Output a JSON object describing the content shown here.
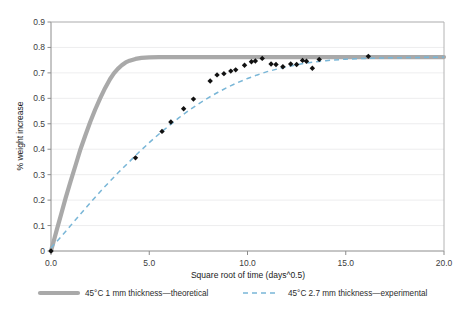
{
  "chart_data": {
    "type": "line",
    "title": "",
    "xlabel": "Square root of time (days^0.5)",
    "ylabel": "% weight increase",
    "xlim": [
      0.0,
      20.0
    ],
    "ylim": [
      0.0,
      0.9
    ],
    "xticks": [
      "0.0",
      "5.0",
      "10.0",
      "15.0",
      "20.0"
    ],
    "xtick_values": [
      0.0,
      5.0,
      10.0,
      15.0,
      20.0
    ],
    "yticks": [
      "0",
      "0.1",
      "0.2",
      "0.3",
      "0.4",
      "0.5",
      "0.6",
      "0.7",
      "0.8",
      "0.9"
    ],
    "ytick_values": [
      0,
      0.1,
      0.2,
      0.3,
      0.4,
      0.5,
      0.6,
      0.7,
      0.8,
      0.9
    ],
    "grid": "horizontal",
    "legend_position": "bottom",
    "plateau": 0.762,
    "series": [
      {
        "name": "45°C 1 mm thickness—theoretical",
        "style": "solid",
        "color": "#a9a9a9",
        "x": [
          0.0,
          0.15,
          0.3,
          0.5,
          0.75,
          1.0,
          1.25,
          1.5,
          1.75,
          2.0,
          2.25,
          2.5,
          2.75,
          3.0,
          3.2,
          3.4,
          3.6,
          3.8,
          4.0,
          4.3,
          4.6,
          5.0,
          5.5,
          6.0,
          7.0,
          8.0,
          10.0,
          12.0,
          14.0,
          16.0,
          18.0,
          20.0
        ],
        "y": [
          0.0,
          0.042,
          0.085,
          0.14,
          0.21,
          0.275,
          0.337,
          0.4,
          0.455,
          0.508,
          0.556,
          0.6,
          0.64,
          0.675,
          0.698,
          0.716,
          0.73,
          0.741,
          0.748,
          0.755,
          0.759,
          0.761,
          0.762,
          0.762,
          0.762,
          0.762,
          0.762,
          0.762,
          0.762,
          0.762,
          0.762,
          0.762
        ]
      },
      {
        "name": "45°C 2.7 mm thickness—experimental",
        "style": "dashed",
        "color": "#79b6d7",
        "x": [
          0.0,
          0.5,
          1.0,
          1.5,
          2.0,
          2.5,
          3.0,
          3.5,
          4.0,
          4.5,
          5.0,
          5.5,
          6.0,
          6.5,
          7.0,
          7.5,
          8.0,
          8.5,
          9.0,
          9.5,
          10.0,
          10.5,
          11.0,
          11.5,
          12.0,
          12.5,
          13.0,
          14.0,
          15.0,
          16.0,
          17.0,
          18.0,
          19.0,
          20.0
        ],
        "y": [
          0.012,
          0.055,
          0.1,
          0.145,
          0.19,
          0.233,
          0.274,
          0.314,
          0.352,
          0.39,
          0.426,
          0.46,
          0.492,
          0.523,
          0.552,
          0.578,
          0.602,
          0.624,
          0.644,
          0.662,
          0.678,
          0.692,
          0.705,
          0.715,
          0.724,
          0.732,
          0.739,
          0.748,
          0.754,
          0.757,
          0.759,
          0.76,
          0.761,
          0.762
        ]
      }
    ],
    "scatter": {
      "name": "experimental measurements",
      "marker": "diamond",
      "color": "#111111",
      "points": [
        [
          0.0,
          0.0
        ],
        [
          4.3,
          0.366
        ],
        [
          5.65,
          0.47
        ],
        [
          6.1,
          0.507
        ],
        [
          6.75,
          0.559
        ],
        [
          7.25,
          0.597
        ],
        [
          8.1,
          0.668
        ],
        [
          8.45,
          0.692
        ],
        [
          8.8,
          0.697
        ],
        [
          9.15,
          0.707
        ],
        [
          9.4,
          0.712
        ],
        [
          9.85,
          0.73
        ],
        [
          10.2,
          0.744
        ],
        [
          10.4,
          0.747
        ],
        [
          10.75,
          0.757
        ],
        [
          11.2,
          0.735
        ],
        [
          11.45,
          0.733
        ],
        [
          11.8,
          0.724
        ],
        [
          12.2,
          0.735
        ],
        [
          12.5,
          0.733
        ],
        [
          12.8,
          0.749
        ],
        [
          13.0,
          0.746
        ],
        [
          13.3,
          0.718
        ],
        [
          13.65,
          0.753
        ],
        [
          16.15,
          0.765
        ]
      ]
    }
  },
  "legend": {
    "items": [
      {
        "label": "45°C 1 mm thickness—theoretical",
        "style": "solid",
        "color": "#a9a9a9"
      },
      {
        "label": "45°C 2.7 mm thickness—experimental",
        "style": "dashed",
        "color": "#79b6d7"
      }
    ]
  },
  "colors": {
    "background": "#ffffff",
    "grid": "#e9e9ea",
    "axis": "#8c8c8c",
    "theoretical": "#a9a9a9",
    "experimental": "#79b6d7",
    "marker": "#111111",
    "text": "#2b2b2b"
  }
}
